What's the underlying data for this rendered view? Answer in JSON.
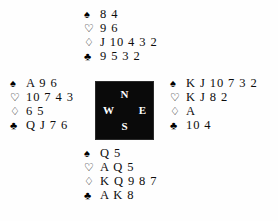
{
  "diagram": {
    "type": "bridge-deal",
    "background_color": "#fefefe",
    "text_color": "#0d0d0d"
  },
  "compass": {
    "box_color": "#0a0a0a",
    "label_color": "#ffffff",
    "north": "N",
    "west": "W",
    "east": "E",
    "south": "S"
  },
  "suits": {
    "spade": "♠",
    "heart": "♡",
    "diamond": "♢",
    "club": "♣"
  },
  "hands": {
    "north": {
      "position": "North",
      "spades": "8 4",
      "hearts": "9 6",
      "diamonds": "J 10 4 3 2",
      "clubs": "9 5 3 2"
    },
    "west": {
      "position": "West",
      "spades": "A 9 6",
      "hearts": "10 7 4 3",
      "diamonds": "6 5",
      "clubs": "Q J 7 6"
    },
    "east": {
      "position": "East",
      "spades": "K J 10 7 3 2",
      "hearts": "K J 8 2",
      "diamonds": "A",
      "clubs": "10 4"
    },
    "south": {
      "position": "South",
      "spades": "Q 5",
      "hearts": "A Q 5",
      "diamonds": "K Q 9 8 7",
      "clubs": "A K 8"
    }
  }
}
